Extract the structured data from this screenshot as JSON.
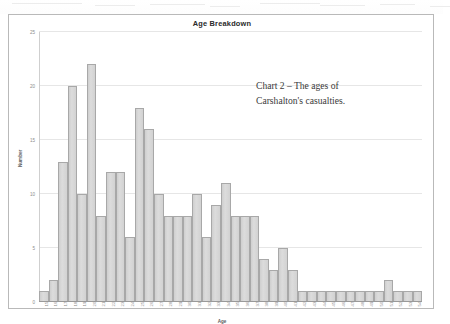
{
  "chart": {
    "title": "Age Breakdown",
    "caption_line1": "Chart 2 – The ages of",
    "caption_line2": "Carshalton's casualties."
  },
  "chart_data": {
    "type": "bar",
    "title": "Age Breakdown",
    "xlabel": "Age",
    "ylabel": "Number",
    "ylim": [
      0,
      25
    ],
    "yticks": [
      0,
      5,
      10,
      15,
      20,
      25
    ],
    "ytick_labels": [
      "0",
      "5",
      "10",
      "15",
      "20",
      "25"
    ],
    "grid": true,
    "legend": false,
    "categories": [
      "15",
      "16",
      "17",
      "18",
      "19",
      "20",
      "21",
      "22",
      "23",
      "24",
      "25",
      "26",
      "27",
      "28",
      "29",
      "30",
      "31",
      "32",
      "33",
      "34",
      "35",
      "36",
      "37",
      "38",
      "39",
      "40",
      "41",
      "42",
      "43",
      "44",
      "45",
      "46",
      "47",
      "48",
      "49",
      "50",
      "51",
      "52",
      "53",
      "54"
    ],
    "values": [
      1,
      2,
      13,
      20,
      10,
      22,
      8,
      12,
      12,
      6,
      18,
      16,
      10,
      8,
      8,
      8,
      10,
      6,
      9,
      11,
      8,
      8,
      8,
      4,
      3,
      5,
      3,
      1,
      1,
      1,
      1,
      1,
      1,
      1,
      1,
      1,
      2,
      1,
      1,
      1
    ],
    "bar_color": "#d3d3d3",
    "bar_edge_color": "#a8a8a8"
  }
}
